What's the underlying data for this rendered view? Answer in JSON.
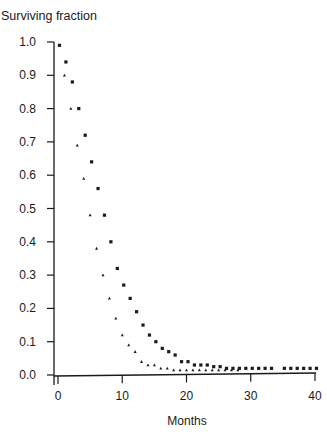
{
  "chart_data": {
    "type": "scatter",
    "title": "Surviving fraction",
    "xlabel": "Months",
    "ylabel": "Surviving fraction",
    "xlim": [
      0,
      40
    ],
    "ylim": [
      0.0,
      1.0
    ],
    "grid": false,
    "legend": null,
    "x_ticks": [
      0,
      10,
      20,
      30,
      40
    ],
    "y_ticks": [
      "0.0",
      "0.1",
      "0.2",
      "0.3",
      "0.4",
      "0.5",
      "0.6",
      "0.7",
      "0.8",
      "0.9",
      "1.0"
    ],
    "series": [
      {
        "name": "Series A (squares)",
        "marker": "square",
        "x": [
          0,
          1,
          2,
          3,
          4,
          5,
          6,
          7,
          8,
          9,
          10,
          11,
          12,
          13,
          14,
          15,
          16,
          17,
          18,
          19,
          20,
          21,
          22,
          23,
          24,
          25,
          26,
          27,
          28,
          29,
          30,
          31,
          32,
          33,
          35,
          36,
          37,
          38,
          39,
          40
        ],
        "values": [
          0.99,
          0.94,
          0.88,
          0.8,
          0.72,
          0.64,
          0.56,
          0.48,
          0.4,
          0.32,
          0.27,
          0.23,
          0.19,
          0.15,
          0.12,
          0.1,
          0.08,
          0.07,
          0.06,
          0.04,
          0.04,
          0.03,
          0.03,
          0.03,
          0.025,
          0.025,
          0.02,
          0.02,
          0.02,
          0.02,
          0.02,
          0.02,
          0.02,
          0.02,
          0.02,
          0.02,
          0.02,
          0.02,
          0.02,
          0.02
        ]
      },
      {
        "name": "Series B (triangles)",
        "marker": "triangle",
        "x": [
          1,
          2,
          3,
          4,
          5,
          6,
          7,
          8,
          9,
          10,
          11,
          12,
          13,
          14,
          15,
          16,
          17,
          18,
          19,
          20,
          21,
          22,
          23,
          24,
          25,
          26,
          27,
          28
        ],
        "values": [
          0.9,
          0.8,
          0.69,
          0.59,
          0.48,
          0.38,
          0.3,
          0.23,
          0.17,
          0.12,
          0.09,
          0.07,
          0.04,
          0.03,
          0.03,
          0.02,
          0.02,
          0.015,
          0.015,
          0.015,
          0.015,
          0.015,
          0.015,
          0.015,
          0.015,
          0.015,
          0.015,
          0.015
        ]
      }
    ]
  },
  "colors": {
    "ink": "#1a1a1a",
    "background": "#ffffff"
  }
}
